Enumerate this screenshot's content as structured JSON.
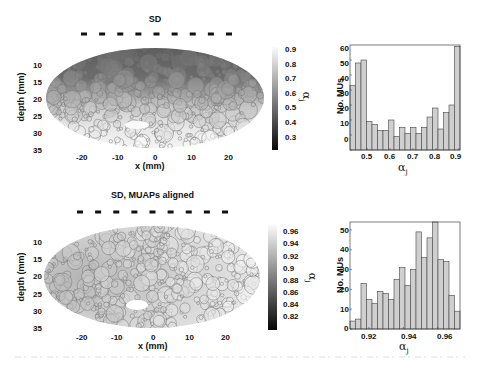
{
  "figure": {
    "panels": [
      {
        "title": "SD",
        "map": {
          "xlabel": "x (mm)",
          "ylabel": "depth (mm)",
          "xticks": [
            "-20",
            "-10",
            "0",
            "10",
            "20"
          ],
          "yticks": [
            "10",
            "15",
            "20",
            "25",
            "30",
            "35"
          ]
        },
        "colorbar": {
          "label": "α_j",
          "label_main": "α",
          "label_sub": "j",
          "ticks": [
            "0.9",
            "0.8",
            "0.7",
            "0.6",
            "0.5",
            "0.4",
            "0.3"
          ]
        },
        "histogram": {
          "ylabel": "No. MUs",
          "xlabel_main": "α",
          "xlabel_sub": "j",
          "xticks": [
            "0.5",
            "0.6",
            "0.7",
            "0.8",
            "0.9"
          ],
          "yticks": [
            "60",
            "50",
            "40",
            "30",
            "20",
            "10",
            "0"
          ]
        }
      },
      {
        "title": "SD, MUAPs aligned",
        "map": {
          "xlabel": "x (mm)",
          "ylabel": "depth (mm)",
          "xticks": [
            "-20",
            "-10",
            "0",
            "10",
            "20"
          ],
          "yticks": [
            "10",
            "15",
            "20",
            "25",
            "30",
            "35"
          ]
        },
        "colorbar": {
          "label": "α_j",
          "label_main": "α",
          "label_sub": "j",
          "ticks": [
            "0.96",
            "0.94",
            "0.92",
            "0.9",
            "0.88",
            "0.86",
            "0.84",
            "0.82"
          ]
        },
        "histogram": {
          "ylabel": "No. MUs",
          "xlabel_main": "α",
          "xlabel_sub": "j",
          "xticks": [
            "0.92",
            "0.94",
            "0.96"
          ],
          "yticks": [
            "50",
            "40",
            "30",
            "20",
            "10",
            "0"
          ]
        }
      }
    ]
  },
  "chart_data": [
    {
      "type": "heatmap",
      "title": "SD",
      "description": "Elliptical muscle cross-section filled with motor unit territories (circles) shaded by α_j; dark at shallow depth, light at deeper depth",
      "xlabel": "x (mm)",
      "ylabel": "depth (mm)",
      "xticks": [
        -20,
        -10,
        0,
        10,
        20
      ],
      "yticks": [
        10,
        15,
        20,
        25,
        30,
        35
      ],
      "colorbar": {
        "label": "α_j",
        "range": [
          0.25,
          0.92
        ],
        "ticks": [
          0.3,
          0.4,
          0.5,
          0.6,
          0.7,
          0.8,
          0.9
        ]
      },
      "electrodes": 9
    },
    {
      "type": "bar",
      "title": "SD histogram",
      "xlabel": "α_j",
      "ylabel": "No. MUs",
      "xlim": [
        0.425,
        0.905
      ],
      "ylim": [
        0,
        70
      ],
      "xticks": [
        0.5,
        0.6,
        0.7,
        0.8,
        0.9
      ],
      "yticks": [
        0,
        10,
        20,
        30,
        40,
        50,
        60
      ],
      "bin_centers": [
        0.437,
        0.462,
        0.487,
        0.512,
        0.537,
        0.562,
        0.587,
        0.612,
        0.637,
        0.662,
        0.687,
        0.712,
        0.737,
        0.762,
        0.787,
        0.812,
        0.837,
        0.862,
        0.887
      ],
      "values": [
        43,
        58,
        60,
        19,
        17,
        13,
        13,
        20,
        9,
        15,
        11,
        15,
        11,
        15,
        22,
        28,
        14,
        25,
        30,
        69
      ]
    },
    {
      "type": "heatmap",
      "title": "SD, MUAPs aligned",
      "description": "Elliptical muscle cross-section with motor unit territories shaded by α_j after MUAP alignment; mostly light gray with darker left region",
      "xlabel": "x (mm)",
      "ylabel": "depth (mm)",
      "xticks": [
        -20,
        -10,
        0,
        10,
        20
      ],
      "yticks": [
        10,
        15,
        20,
        25,
        30,
        35
      ],
      "colorbar": {
        "label": "α_j",
        "range": [
          0.81,
          0.975
        ],
        "ticks": [
          0.82,
          0.84,
          0.86,
          0.88,
          0.9,
          0.92,
          0.94,
          0.96
        ]
      },
      "electrodes": 9
    },
    {
      "type": "bar",
      "title": "SD, MUAPs aligned histogram",
      "xlabel": "α_j",
      "ylabel": "No. MUs",
      "xlim": [
        0.909,
        0.973
      ],
      "ylim": [
        0,
        54
      ],
      "xticks": [
        0.92,
        0.94,
        0.96
      ],
      "yticks": [
        0,
        10,
        20,
        30,
        40,
        50
      ],
      "values": [
        4,
        5,
        23,
        15,
        13,
        19,
        18,
        15,
        25,
        31,
        22,
        30,
        49,
        36,
        46,
        54,
        35,
        34,
        17,
        9
      ]
    }
  ]
}
